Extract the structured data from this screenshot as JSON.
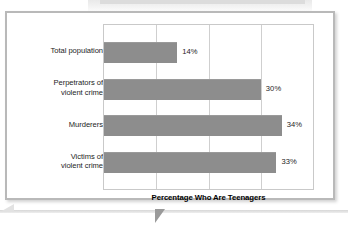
{
  "figure": {
    "axis_title": "Percentage Who Are Teenagers",
    "bar_color": "#8d8d8d",
    "grid_color": "#cfcfcf",
    "frame_color": "#b9b9b9",
    "background": "#ffffff"
  },
  "chart_data": {
    "type": "bar",
    "orientation": "horizontal",
    "title": "",
    "subtitle": "",
    "xlabel": "Percentage Who Are Teenagers",
    "ylabel": "",
    "categories": [
      "Total population",
      "Perpetrators of violent crime",
      "Murderers",
      "Victims of violent crime"
    ],
    "category_lines": [
      [
        "Total population"
      ],
      [
        "Perpetrators of",
        "violent crime"
      ],
      [
        "Murderers"
      ],
      [
        "Victims of",
        "violent crime"
      ]
    ],
    "values": [
      14,
      30,
      34,
      33
    ],
    "data_labels": [
      "14%",
      "30%",
      "34%",
      "33%"
    ],
    "xlim": [
      0,
      40
    ],
    "xticks": [
      0,
      10,
      20,
      30,
      40
    ],
    "tick_labels_visible": false,
    "grid": true,
    "grid_axis": "x",
    "legend": false,
    "legend_position": "none",
    "series": [
      {
        "name": "Percentage Who Are Teenagers",
        "values": [
          14,
          30,
          34,
          33
        ]
      }
    ]
  }
}
